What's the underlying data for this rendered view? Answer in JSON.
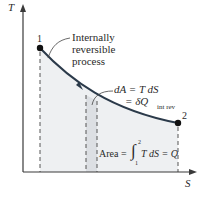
{
  "diagram": {
    "type": "T-S diagram",
    "axes": {
      "y_label": "T",
      "x_label": "S"
    },
    "points": [
      {
        "id": "1",
        "label": "1"
      },
      {
        "id": "2",
        "label": "2"
      }
    ],
    "annotations": {
      "process_line1": "Internally",
      "process_line2": "reversible",
      "process_line3": "process",
      "da_line1": "dA = T dS",
      "da_line2": "= δQ",
      "da_sub": "int rev",
      "area_prefix": "Area =",
      "area_integral": "∫",
      "area_upper": "2",
      "area_lower": "1",
      "area_suffix": "T dS = Q"
    },
    "colors": {
      "curve": "#2b3a4a",
      "shade": "#eef0f2",
      "strip": "#dcdfe3",
      "axis": "#3a3a3a",
      "point": "#111111"
    }
  }
}
